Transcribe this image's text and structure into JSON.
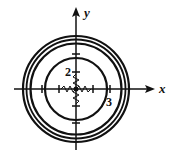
{
  "diagram": {
    "type": "level-curves",
    "axes": {
      "x_label": "x",
      "y_label": "y"
    },
    "labels": {
      "inner": "2",
      "outer": "3"
    },
    "circles_radii_px": [
      31,
      46,
      49,
      52
    ],
    "center_px": [
      76,
      89
    ]
  }
}
